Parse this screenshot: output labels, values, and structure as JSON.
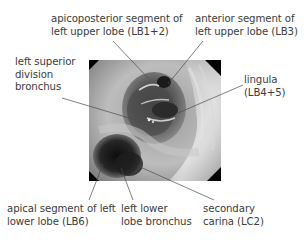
{
  "figure": {
    "type": "bronchoscopy-annotated-image",
    "labels": {
      "apicoposterior": {
        "lines": [
          "apicoposterior segment of",
          "left upper lobe (LB1+2)"
        ]
      },
      "anterior": {
        "lines": [
          "anterior segment of",
          "left upper lobe (LB3)"
        ]
      },
      "left_superior_division": {
        "lines": [
          "left superior",
          "division",
          "bronchus"
        ]
      },
      "lingula": {
        "lines": [
          "lingula",
          "(LB4+5)"
        ]
      },
      "apical_segment": {
        "lines": [
          "apical segment of left",
          "lower lobe (LB6)"
        ]
      },
      "left_lower_lobe": {
        "lines": [
          "left lower",
          "lobe bronchus"
        ]
      },
      "secondary_carina": {
        "lines": [
          "secondary",
          "carina (LC2)"
        ]
      }
    },
    "colors": {
      "text": "#3c3c3c",
      "leader": "#4a4a4a",
      "background": "#ffffff"
    }
  }
}
